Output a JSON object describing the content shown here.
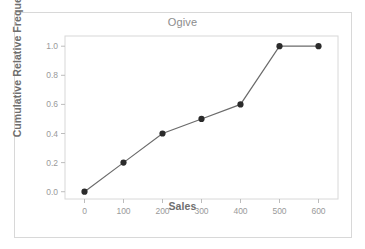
{
  "chart_data": {
    "type": "line",
    "title": "Ogive",
    "xlabel": "Sales",
    "ylabel": "Cumulative Relative Frequency",
    "x": [
      0,
      100,
      200,
      300,
      400,
      500,
      600
    ],
    "values": [
      0.0,
      0.2,
      0.4,
      0.5,
      0.6,
      1.0,
      1.0
    ],
    "series": [
      {
        "name": "Cumulative Relative Frequency",
        "x": [
          0,
          100,
          200,
          300,
          400,
          500,
          600
        ],
        "values": [
          0.0,
          0.2,
          0.4,
          0.5,
          0.6,
          1.0,
          1.0
        ]
      }
    ],
    "xlim": [
      -50,
      650
    ],
    "ylim": [
      -0.05,
      1.07
    ],
    "xticks": [
      0,
      100,
      200,
      300,
      400,
      500,
      600
    ],
    "xtick_labels": [
      "0",
      "100",
      "200",
      "300",
      "400",
      "500",
      "600"
    ],
    "yticks": [
      0.0,
      0.2,
      0.4,
      0.6,
      0.8,
      1.0
    ],
    "ytick_labels": [
      "0.0",
      "0.2",
      "0.4",
      "0.6",
      "0.8",
      "1.0"
    ],
    "grid": false,
    "legend": false,
    "legend_position": "none",
    "marker": "filled-circle",
    "line_color": "#6b6b6b",
    "marker_color": "#2b2b2b",
    "title_color": "#8c8c8c",
    "axis_label_color": "#6e6e6e",
    "tick_label_color": "#9a9a9a",
    "plot_background": "#ffffff",
    "frame_color": "#d8d8d8",
    "axis_color": "#bdbdbd"
  }
}
